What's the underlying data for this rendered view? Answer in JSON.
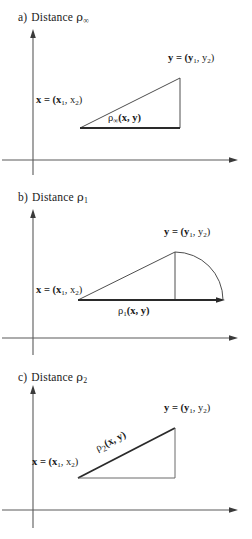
{
  "figure": {
    "background": "#ffffff",
    "ink": "#1a1a1a",
    "axis_color": "#5a5a5a"
  },
  "panels": [
    {
      "id": "a",
      "caption_letter": "a)",
      "caption_word": "Distance",
      "caption_symbol": "ρ",
      "caption_sub": "∞",
      "x_label": "x = (x",
      "x_label_sub1": "1",
      "x_label_mid": ", x",
      "x_label_sub2": "2",
      "x_label_end": ")",
      "y_label": "y = (y",
      "y_label_sub1": "1",
      "y_label_mid": ", y",
      "y_label_sub2": "2",
      "y_label_end": ")",
      "distance_symbol": "ρ",
      "distance_sub": "∞",
      "distance_args": "(x, y)",
      "geometry": "right triangle, emphasized horizontal base = Chebyshev distance"
    },
    {
      "id": "b",
      "caption_letter": "b)",
      "caption_word": "Distance",
      "caption_symbol": "ρ",
      "caption_sub": "1",
      "x_label": "x = (x",
      "x_label_sub1": "1",
      "x_label_mid": ", x",
      "x_label_sub2": "2",
      "x_label_end": ")",
      "y_label": "y = (y",
      "y_label_sub1": "1",
      "y_label_mid": ", y",
      "y_label_sub2": "2",
      "y_label_end": ")",
      "distance_symbol": "ρ",
      "distance_sub": "1",
      "distance_args": "(x, y)",
      "geometry": "triangle with vertical drop from y and arc sweeping to end of base = Manhattan distance"
    },
    {
      "id": "c",
      "caption_letter": "c)",
      "caption_word": "Distance",
      "caption_symbol": "ρ",
      "caption_sub": "2",
      "x_label": "x = (x",
      "x_label_sub1": "1",
      "x_label_mid": ", x",
      "x_label_sub2": "2",
      "x_label_end": ")",
      "y_label": "y = (y",
      "y_label_sub1": "1",
      "y_label_mid": ", y",
      "y_label_sub2": "2",
      "y_label_end": ")",
      "distance_symbol": "ρ",
      "distance_sub": "2",
      "distance_args": "(x, y)",
      "geometry": "right triangle with emphasized hypotenuse = Euclidean distance"
    }
  ]
}
